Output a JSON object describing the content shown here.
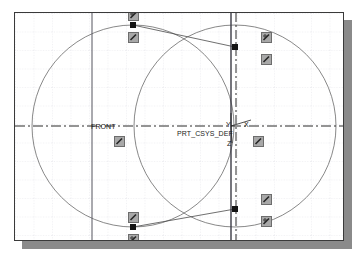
{
  "app": {
    "view_name": "cad-sketch-viewport",
    "background_color": "#ffffff",
    "frame_border_color": "#3a3a3a",
    "shadow_color": "#8a8a8a",
    "grid_color": "#c8c8d2",
    "geometry_color": "#5d5d5d",
    "centerline_color": "#2a2a2a",
    "vertex_color": "#141414",
    "handle_fill": "#a8a8a8",
    "handle_border": "#6d6d6d"
  },
  "labels": {
    "datum_plane": "FRONT",
    "coordinate_system": "PRT_CSYS_DEF",
    "axis_x": "X",
    "axis_y": "Y",
    "axis_z": "Z"
  },
  "handles": [
    {
      "name": "tangent-constraint-top-left-upper",
      "icon": "tangent-icon"
    },
    {
      "name": "tangent-constraint-top-left-lower",
      "icon": "tangent-icon"
    },
    {
      "name": "tangent-constraint-top-right-upper",
      "icon": "tangent-icon"
    },
    {
      "name": "tangent-constraint-top-right-lower",
      "icon": "tangent-icon"
    },
    {
      "name": "tangent-constraint-bottom-left-upper",
      "icon": "tangent-icon"
    },
    {
      "name": "tangent-constraint-bottom-left-lower",
      "icon": "tangent-icon"
    },
    {
      "name": "tangent-constraint-bottom-right-upper",
      "icon": "tangent-icon"
    },
    {
      "name": "tangent-constraint-bottom-right-lower",
      "icon": "tangent-icon"
    },
    {
      "name": "tangent-constraint-center-left",
      "icon": "tangent-icon"
    },
    {
      "name": "tangent-constraint-center-right",
      "icon": "tangent-icon"
    }
  ],
  "vertices": [
    {
      "name": "sketch-vertex-top-left"
    },
    {
      "name": "sketch-vertex-top-right"
    },
    {
      "name": "sketch-vertex-bottom-left"
    },
    {
      "name": "sketch-vertex-bottom-right"
    }
  ],
  "chart_data": {
    "type": "scatter",
    "title": "",
    "xlabel": "",
    "ylabel": "",
    "grid": true,
    "legend": "none",
    "circles": [
      {
        "name": "left-circle",
        "cx": 118,
        "cy": 113,
        "r": 101
      },
      {
        "name": "right-circle",
        "cx": 220,
        "cy": 113,
        "r": 101
      }
    ],
    "tangent_lines": [
      {
        "name": "upper-tangent-line",
        "x1": 118,
        "y1": 12,
        "x2": 220,
        "y2": 12
      },
      {
        "name": "lower-tangent-line",
        "x1": 118,
        "y1": 214,
        "x2": 220,
        "y2": 214
      }
    ],
    "centerlines": [
      {
        "name": "horizontal-centerline",
        "orientation": "horizontal",
        "position": 113,
        "style": "dash-dot"
      },
      {
        "name": "vertical-centerline-right",
        "orientation": "vertical",
        "position": 220,
        "style": "dash-dot"
      }
    ],
    "datum_lines": [
      {
        "name": "front-datum-line",
        "orientation": "vertical",
        "position": 77,
        "style": "solid"
      },
      {
        "name": "right-datum-line",
        "orientation": "vertical",
        "position": 216,
        "style": "solid"
      }
    ],
    "vertex_points": [
      {
        "name": "top-left",
        "x": 118,
        "y": 12
      },
      {
        "name": "top-right",
        "x": 220,
        "y": 34
      },
      {
        "name": "bottom-left",
        "x": 118,
        "y": 214
      },
      {
        "name": "bottom-right",
        "x": 220,
        "y": 196
      }
    ]
  }
}
